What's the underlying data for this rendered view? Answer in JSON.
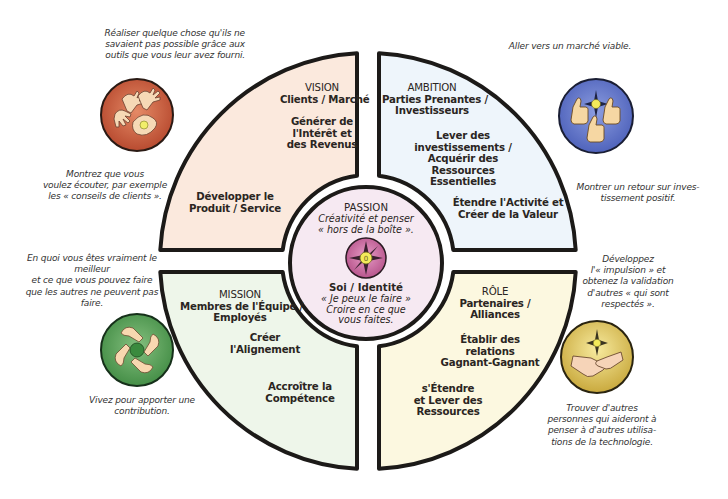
{
  "diagram": {
    "type": "wheel",
    "center": {
      "title": "PASSION",
      "subtitle_lines": [
        "Créativité et penser",
        "« hors de la boîte »."
      ],
      "identity_title": "Soi / Identité",
      "identity_lines": [
        "« Je peux le faire »",
        "Croire en ce que",
        "vous faites."
      ],
      "icon": "compass-star-icon",
      "fill": "#f6e9f2",
      "icon_color": "#c2659a"
    },
    "quadrants": [
      {
        "id": "vision",
        "position": "top-left",
        "fill": "#fbe9dd",
        "blocks": [
          [
            "VISION",
            "Clients / Marché"
          ],
          [
            "Générer de",
            "l'Intérêt et",
            "des Revenus"
          ],
          [
            "Développer le",
            "Produit / Service"
          ]
        ]
      },
      {
        "id": "ambition",
        "position": "top-right",
        "fill": "#eef5fb",
        "blocks": [
          [
            "AMBITION",
            "Parties Prenantes /",
            "Investisseurs"
          ],
          [
            "Lever des",
            "investissements /",
            "Acquérir des",
            "Ressources",
            "Essentielles"
          ],
          [
            "Étendre l'Activité et",
            "Créer de la Valeur"
          ]
        ]
      },
      {
        "id": "mission",
        "position": "bottom-left",
        "fill": "#eef6ea",
        "blocks": [
          [
            "MISSION",
            "Membres de l'Équipe /",
            "Employés"
          ],
          [
            "Créer",
            "l'Alignement"
          ],
          [
            "Accroître la",
            "Compétence"
          ]
        ]
      },
      {
        "id": "role",
        "position": "bottom-right",
        "fill": "#fcf8e0",
        "blocks": [
          [
            "RÔLE",
            "Partenaires /",
            "Alliances"
          ],
          [
            "Établir des",
            "relations",
            "Gagnant-Gagnant"
          ],
          [
            "s'Étendre",
            "et Lever des",
            "Ressources"
          ]
        ]
      }
    ],
    "icons": [
      {
        "id": "vision-icon",
        "name": "reaching-hands-icon",
        "color": "#c8583a"
      },
      {
        "id": "ambition-icon",
        "name": "thumbs-up-icon",
        "color": "#5b6fc4"
      },
      {
        "id": "mission-icon",
        "name": "linked-arms-icon",
        "color": "#4f9a4f"
      },
      {
        "id": "role-icon",
        "name": "handshake-icon",
        "color": "#d9c257"
      }
    ],
    "notes": {
      "vision_top": [
        "Réaliser quelque chose qu'ils ne",
        "savaient pas possible grâce aux",
        "outils que vous leur avez fourni."
      ],
      "vision_bottom": [
        "Montrez que vous",
        "voulez écouter, par exemple",
        "les « conseils de clients »."
      ],
      "ambition_top": [
        "Aller vers un marché viable."
      ],
      "ambition_bottom": [
        "Montrer un retour sur inves-",
        "tissement positif."
      ],
      "mission_top": [
        "En quoi vous êtes vraiment le",
        "meilleur",
        "et ce que vous pouvez faire",
        "que les autres ne peuvent pas",
        "faire."
      ],
      "mission_bottom": [
        "Vivez pour apporter une",
        "contribution."
      ],
      "role_top": [
        "Développez",
        "l'« impulsion » et",
        "obtenez la validation",
        "d'autres « qui sont",
        "respectés »."
      ],
      "role_bottom": [
        "Trouver d'autres",
        "personnes qui aideront à",
        "penser à d'autres utilisa-",
        "tions de la technologie."
      ]
    },
    "colors": {
      "outline": "#1c1a18",
      "text": "#2a2522",
      "note_text": "#333333"
    }
  }
}
